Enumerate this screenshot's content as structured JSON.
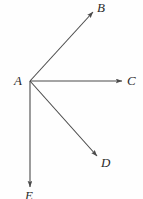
{
  "figure": {
    "type": "geometry-diagram",
    "background_color": "#fefefe",
    "stroke_color": "#4a4a4a",
    "label_color": "#2b2b2b",
    "vertex": {
      "name": "A",
      "label": "A",
      "x": 30,
      "y": 81,
      "label_x": 14,
      "label_y": 74
    },
    "rays": [
      {
        "name": "ray-AB",
        "label": "B",
        "from_x": 30,
        "from_y": 81,
        "to_x": 93,
        "to_y": 12,
        "label_x": 97,
        "label_y": 1,
        "arrowhead": true
      },
      {
        "name": "ray-AC",
        "label": "C",
        "from_x": 30,
        "from_y": 81,
        "to_x": 122,
        "to_y": 81,
        "label_x": 127,
        "label_y": 74,
        "arrowhead": true
      },
      {
        "name": "ray-AD",
        "label": "D",
        "from_x": 30,
        "from_y": 81,
        "to_x": 97,
        "to_y": 156,
        "label_x": 101,
        "label_y": 156,
        "arrowhead": true
      },
      {
        "name": "ray-AE",
        "label": "E",
        "from_x": 30,
        "from_y": 81,
        "to_x": 30,
        "to_y": 187,
        "label_x": 25,
        "label_y": 189,
        "arrowhead": true
      }
    ]
  }
}
